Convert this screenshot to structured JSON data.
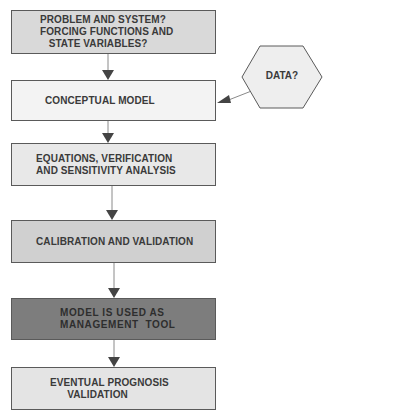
{
  "diagram": {
    "boxes": [
      {
        "id": "problem",
        "lines": [
          "PROBLEM AND SYSTEM?",
          "FORCING FUNCTIONS AND",
          "   STATE VARIABLES?"
        ],
        "fill": "#d9d9d9",
        "top": 10,
        "height": 44,
        "pad": 28
      },
      {
        "id": "conceptual",
        "lines": [
          "CONCEPTUAL MODEL"
        ],
        "fill": "#f3f3f3",
        "top": 80,
        "height": 41,
        "pad": 33
      },
      {
        "id": "equations",
        "lines": [
          "EQUATIONS, VERIFICATION",
          "AND SENSITIVITY ANALYSIS"
        ],
        "fill": "#e8e8e8",
        "top": 143,
        "height": 43,
        "pad": 24
      },
      {
        "id": "calibration",
        "lines": [
          "CALIBRATION AND VALIDATION"
        ],
        "fill": "#d0d0d0",
        "top": 220,
        "height": 43,
        "pad": 24
      },
      {
        "id": "management",
        "lines": [
          "MODEL IS USED AS",
          "MANAGEMENT  TOOL"
        ],
        "fill": "#7d7d7d",
        "top": 298,
        "height": 42,
        "pad": 48
      },
      {
        "id": "prognosis",
        "lines": [
          "EVENTUAL PROGNOSIS",
          "      VALIDATION"
        ],
        "fill": "#e4e4e4",
        "top": 367,
        "height": 43,
        "pad": 38
      }
    ],
    "data_node": {
      "label": "DATA?",
      "fill": "#eeeeee"
    },
    "colors": {
      "border": "#5a5a5a",
      "arrow": "#444444",
      "text": "#3a3a3a"
    }
  }
}
